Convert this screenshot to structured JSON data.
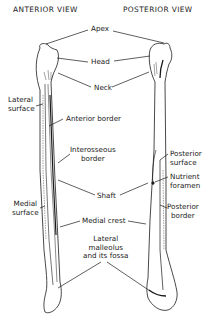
{
  "figure": {
    "views": {
      "anterior": "ANTERIOR VIEW",
      "posterior": "POSTERIOR VIEW"
    },
    "labels": {
      "apex": "Apex",
      "head": "Head",
      "neck": "Neck",
      "lateral_surface_1": "Lateral",
      "lateral_surface_2": "surface",
      "anterior_border": "Anterior border",
      "interosseous_border_1": "Interosseous",
      "interosseous_border_2": "border",
      "posterior_surface_1": "Posterior",
      "posterior_surface_2": "surface",
      "nutrient_foramen_1": "Nutrient",
      "nutrient_foramen_2": "foramen",
      "shaft": "Shaft",
      "medial_surface_1": "Medial",
      "medial_surface_2": "surface",
      "posterior_border_1": "Posterior",
      "posterior_border_2": "border",
      "medial_crest": "Medial crest",
      "lateral_malleolus_1": "Lateral",
      "lateral_malleolus_2": "malleolus",
      "lateral_malleolus_3": "and its fossa"
    },
    "colors": {
      "ink": "#1a1a1a",
      "background": "#ffffff"
    }
  }
}
